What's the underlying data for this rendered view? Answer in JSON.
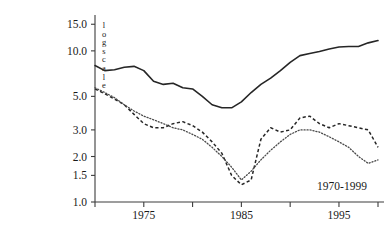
{
  "chart_data": {
    "type": "line",
    "title": "",
    "subtitle": "",
    "xlabel": "",
    "ylabel": "log scale",
    "annotation": "1970-1999",
    "grid": false,
    "legend": "none",
    "yscale": "log",
    "ylim": [
      1.0,
      16.5
    ],
    "xlim": [
      1970,
      1999
    ],
    "yticks": [
      1.0,
      1.5,
      2.0,
      3.0,
      5.0,
      10.0,
      15.0
    ],
    "ytick_labels": [
      "1.0",
      "1.5",
      "2.0",
      "3.0",
      "5.0",
      "10.0",
      "15.0"
    ],
    "xticks": [
      1970,
      1975,
      1980,
      1985,
      1990,
      1995,
      1999
    ],
    "xtick_labels": [
      "",
      "1975",
      "",
      "1985",
      "",
      "1995",
      ""
    ],
    "x": [
      1970,
      1971,
      1972,
      1973,
      1974,
      1975,
      1976,
      1977,
      1978,
      1979,
      1980,
      1981,
      1982,
      1983,
      1984,
      1985,
      1986,
      1987,
      1988,
      1989,
      1990,
      1991,
      1992,
      1993,
      1994,
      1995,
      1996,
      1997,
      1998,
      1999
    ],
    "series": [
      {
        "name": "solid-line",
        "style": "solid",
        "color": "#262626",
        "values": [
          8.0,
          7.4,
          7.5,
          7.8,
          7.9,
          7.4,
          6.3,
          6.0,
          6.1,
          5.7,
          5.6,
          5.0,
          4.4,
          4.2,
          4.2,
          4.6,
          5.3,
          6.0,
          6.6,
          7.4,
          8.4,
          9.3,
          9.6,
          9.9,
          10.3,
          10.6,
          10.7,
          10.7,
          11.3,
          11.7
        ]
      },
      {
        "name": "dashed-line",
        "style": "dashed",
        "color": "#262626",
        "values": [
          5.6,
          5.2,
          4.8,
          4.4,
          3.8,
          3.3,
          3.1,
          3.1,
          3.3,
          3.4,
          3.2,
          2.9,
          2.5,
          2.1,
          1.5,
          1.3,
          1.4,
          2.6,
          3.1,
          2.9,
          3.0,
          3.6,
          3.7,
          3.3,
          3.1,
          3.3,
          3.2,
          3.1,
          3.0,
          2.3
        ]
      },
      {
        "name": "dotted-line",
        "style": "dotted",
        "color": "#4a4a4a",
        "values": [
          5.7,
          5.3,
          4.9,
          4.4,
          4.0,
          3.7,
          3.5,
          3.3,
          3.1,
          3.0,
          2.8,
          2.6,
          2.3,
          2.0,
          1.7,
          1.4,
          1.6,
          1.9,
          2.2,
          2.5,
          2.8,
          3.0,
          3.0,
          2.9,
          2.7,
          2.5,
          2.3,
          2.0,
          1.8,
          1.9
        ]
      }
    ]
  },
  "axis": {
    "vertical_label_letters": [
      "l",
      "o",
      "g",
      "s",
      "c",
      "a",
      "l",
      "e"
    ]
  }
}
